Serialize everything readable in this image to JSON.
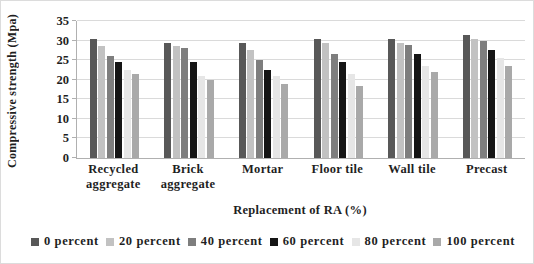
{
  "figure": {
    "width_px": 534,
    "height_px": 264,
    "background": "#ffffff",
    "text_color": "#1f1f1f",
    "gridline_color": "#dadada",
    "axis_color": "#b0b0b0"
  },
  "chart_data": {
    "type": "bar",
    "title": "",
    "xlabel": "Replacement of RA (%)",
    "ylabel": "Compressive strength (Mpa)",
    "ylim": [
      0,
      35
    ],
    "yticks": [
      0,
      5,
      10,
      15,
      20,
      25,
      30,
      35
    ],
    "grid": true,
    "legend_position": "bottom",
    "categories": [
      "Recycled aggregate",
      "Brick aggregate",
      "Mortar",
      "Floor tile",
      "Wall tile",
      "Precast"
    ],
    "category_label_lines": [
      [
        "Recycled",
        "aggregate"
      ],
      [
        "Brick",
        "aggregate"
      ],
      [
        "Mortar"
      ],
      [
        "Floor  tile"
      ],
      [
        "Wall tile"
      ],
      [
        "Precast"
      ]
    ],
    "series": [
      {
        "name": "0 percent",
        "color": "#585858",
        "values": [
          30.5,
          29.5,
          29.5,
          30.5,
          30.5,
          31.5
        ]
      },
      {
        "name": "20 percent",
        "color": "#c2c2c2",
        "values": [
          28.5,
          28.5,
          27.5,
          29.5,
          29.5,
          30.5
        ]
      },
      {
        "name": "40 percent",
        "color": "#7e7e7e",
        "values": [
          26.0,
          28.0,
          25.0,
          26.5,
          29.0,
          30.0
        ]
      },
      {
        "name": "60 percent",
        "color": "#151515",
        "values": [
          24.5,
          24.5,
          22.5,
          24.5,
          26.5,
          27.5
        ]
      },
      {
        "name": "80 percent",
        "color": "#e6e6e6",
        "values": [
          22.5,
          21.0,
          21.0,
          21.5,
          23.5,
          25.5
        ]
      },
      {
        "name": "100 percent",
        "color": "#a9a9a9",
        "values": [
          21.5,
          20.0,
          19.0,
          18.5,
          22.0,
          23.5
        ]
      }
    ]
  }
}
